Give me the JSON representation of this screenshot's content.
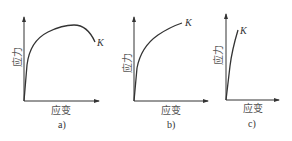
{
  "figure": {
    "panels": [
      {
        "id": "a",
        "caption": "a)",
        "y_label": "应力",
        "x_label": "应变",
        "end_point_label": "K",
        "description": "stress rises steeply, curves to a maximum, then falls to fracture point K"
      },
      {
        "id": "b",
        "caption": "b)",
        "y_label": "应力",
        "x_label": "应变",
        "end_point_label": "K",
        "description": "stress rises steeply then increases monotonically to fracture point K"
      },
      {
        "id": "c",
        "caption": "c)",
        "y_label": "应力",
        "x_label": "应变",
        "end_point_label": "K",
        "description": "nearly linear steep rise to fracture point K with little strain"
      }
    ],
    "colors": {
      "line": "#333333",
      "text": "#555555",
      "background": "#ffffff"
    }
  }
}
